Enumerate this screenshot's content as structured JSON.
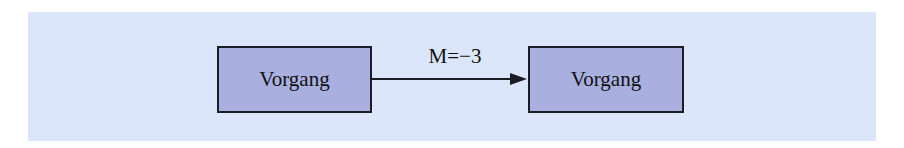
{
  "diagram": {
    "type": "flow",
    "nodes": [
      {
        "id": "a",
        "label": "Vorgang"
      },
      {
        "id": "b",
        "label": "Vorgang"
      }
    ],
    "edges": [
      {
        "from": "a",
        "to": "b",
        "label": "M=−3",
        "directed": true
      }
    ]
  },
  "colors": {
    "panel_background": "#dce6fa",
    "node_fill": "#a9b0df",
    "node_border": "#1c1c24",
    "edge": "#1c1c24",
    "text": "#111111"
  }
}
